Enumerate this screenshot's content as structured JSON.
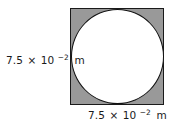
{
  "figure": {
    "shape": {
      "outer": "square",
      "inner": "circle",
      "outer_fill_color": "#999999",
      "inner_fill_color": "#ffffff",
      "stroke_color": "#1a1a1a"
    },
    "labels": {
      "left": {
        "mantissa": "7.5",
        "multiplication_sign": "×",
        "base": "10",
        "exponent": "−2",
        "unit": "m",
        "full_text": "7.5 × 10−2 m",
        "describes": "square side length (vertical)"
      },
      "bottom": {
        "mantissa": "7.5",
        "multiplication_sign": "×",
        "base": "10",
        "exponent": "−2",
        "unit": "m",
        "full_text": "7.5 × 10−2 m",
        "describes": "square side length (horizontal)"
      }
    }
  }
}
